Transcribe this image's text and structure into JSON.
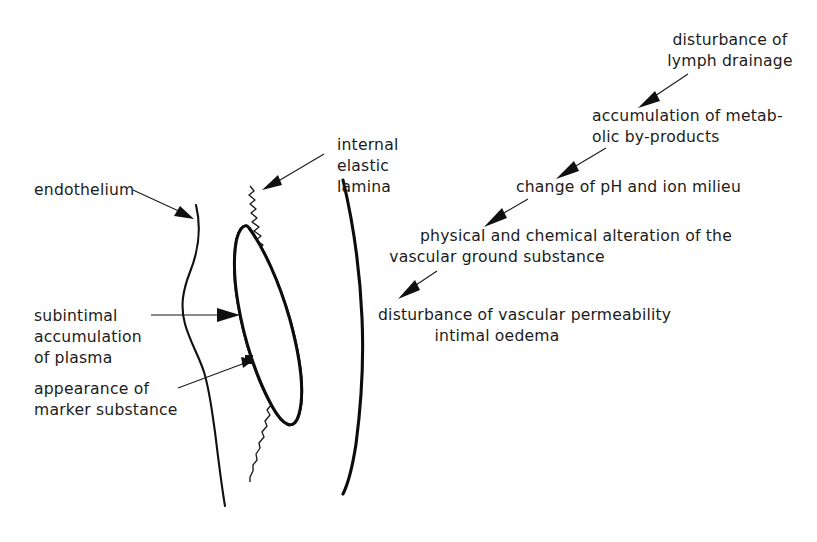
{
  "figure": {
    "background_color": "#ffffff",
    "ink_color": "#1b1b1b"
  },
  "anatomy_labels": {
    "endothelium": "endothelium",
    "internal_elastic_lamina": {
      "line1": "internal",
      "line2": "elastic",
      "line3": "lamina"
    },
    "subintimal_accumulation": {
      "line1": "subintimal",
      "line2": "accumulation",
      "line3": "of plasma"
    },
    "marker_substance": {
      "line1": "appearance of",
      "line2": "marker substance"
    }
  },
  "flowchart": {
    "steps": [
      {
        "id": "lymph-drainage",
        "lines": [
          "disturbance of",
          "lymph drainage"
        ]
      },
      {
        "id": "metabolic-byproducts",
        "lines": [
          "accumulation of metab-",
          "olic by-products"
        ]
      },
      {
        "id": "ph-ion-milieu",
        "lines": [
          "change of pH and ion milieu"
        ]
      },
      {
        "id": "ground-substance",
        "lines": [
          "physical and chemical alteration of the",
          "vascular ground substance"
        ]
      },
      {
        "id": "vascular-permeability",
        "lines": [
          "disturbance of vascular permeability",
          "intimal oedema"
        ]
      }
    ]
  }
}
